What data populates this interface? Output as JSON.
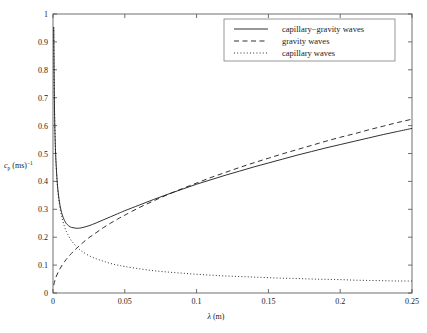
{
  "figure": {
    "background": "#ffffff",
    "foreground": "#1a1a1a"
  },
  "axes": {
    "xlabel_symbol": "λ",
    "xlabel_units": "(m)",
    "ylabel_symbol": "c",
    "ylabel_sub": "p",
    "ylabel_units": "(ms)",
    "ylabel_exp": "−1",
    "x_ticks": [
      "0",
      "0.05",
      "0.1",
      "0.15",
      "0.2",
      "0.25"
    ],
    "y_ticks": [
      "0",
      "0.1",
      "0.2",
      "0.3",
      "0.4",
      "0.5",
      "0.6",
      "0.7",
      "0.8",
      "0.9",
      "1"
    ]
  },
  "legend": {
    "position": "top-right",
    "entries": [
      {
        "label": "capillary−gravity waves",
        "style": "solid"
      },
      {
        "label": "gravity waves",
        "style": "dashed"
      },
      {
        "label": "capillary waves",
        "style": "dotted"
      }
    ]
  },
  "chart_data": {
    "type": "line",
    "title": "",
    "xlabel": "λ (m)",
    "ylabel": "c_p (ms)⁻¹",
    "xlim": [
      0,
      0.25
    ],
    "ylim": [
      0,
      1
    ],
    "grid": false,
    "legend_position": "top-right",
    "x": [
      0.0005,
      0.001,
      0.0015,
      0.002,
      0.003,
      0.004,
      0.005,
      0.006,
      0.007,
      0.008,
      0.009,
      0.01,
      0.012,
      0.014,
      0.017,
      0.02,
      0.025,
      0.03,
      0.035,
      0.04,
      0.045,
      0.05,
      0.06,
      0.07,
      0.08,
      0.09,
      0.1,
      0.11,
      0.12,
      0.13,
      0.14,
      0.15,
      0.16,
      0.17,
      0.18,
      0.19,
      0.2,
      0.21,
      0.22,
      0.23,
      0.24,
      0.25
    ],
    "series": [
      {
        "name": "capillary−gravity waves",
        "style": "solid",
        "values": [
          0.953,
          0.675,
          0.552,
          0.479,
          0.394,
          0.344,
          0.311,
          0.288,
          0.272,
          0.26,
          0.251,
          0.245,
          0.237,
          0.234,
          0.232,
          0.234,
          0.241,
          0.251,
          0.262,
          0.273,
          0.284,
          0.295,
          0.315,
          0.335,
          0.354,
          0.372,
          0.39,
          0.406,
          0.422,
          0.437,
          0.452,
          0.466,
          0.48,
          0.494,
          0.507,
          0.52,
          0.532,
          0.544,
          0.556,
          0.568,
          0.579,
          0.59
        ]
      },
      {
        "name": "gravity waves",
        "style": "dashed",
        "values": [
          0.028,
          0.039,
          0.048,
          0.056,
          0.068,
          0.079,
          0.088,
          0.097,
          0.105,
          0.112,
          0.119,
          0.125,
          0.137,
          0.148,
          0.163,
          0.177,
          0.198,
          0.216,
          0.234,
          0.25,
          0.265,
          0.279,
          0.306,
          0.33,
          0.353,
          0.374,
          0.394,
          0.414,
          0.432,
          0.45,
          0.467,
          0.483,
          0.499,
          0.514,
          0.529,
          0.544,
          0.558,
          0.571,
          0.585,
          0.598,
          0.611,
          0.623
        ]
      },
      {
        "name": "capillary waves",
        "style": "dotted",
        "values": [
          0.952,
          0.673,
          0.55,
          0.476,
          0.389,
          0.337,
          0.301,
          0.275,
          0.255,
          0.238,
          0.224,
          0.213,
          0.194,
          0.18,
          0.163,
          0.15,
          0.134,
          0.123,
          0.114,
          0.106,
          0.1,
          0.095,
          0.087,
          0.08,
          0.075,
          0.071,
          0.067,
          0.064,
          0.061,
          0.059,
          0.057,
          0.055,
          0.053,
          0.052,
          0.05,
          0.049,
          0.048,
          0.046,
          0.045,
          0.044,
          0.043,
          0.043
        ]
      }
    ]
  }
}
